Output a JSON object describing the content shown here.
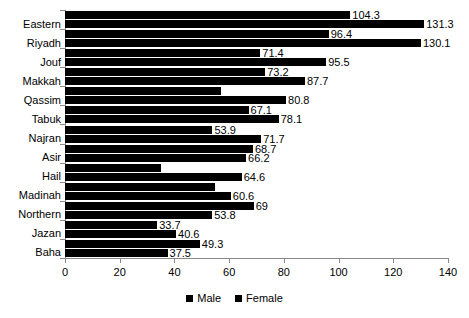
{
  "chart_data": {
    "type": "bar",
    "orientation": "horizontal",
    "title": "",
    "subtitle": "",
    "xlabel": "",
    "ylabel": "",
    "xlim": [
      0,
      140
    ],
    "xticks": [
      0,
      20,
      40,
      60,
      80,
      100,
      120,
      140
    ],
    "xtick_labels": [
      "0",
      "20",
      "40",
      "60",
      "80",
      "100",
      "120",
      "140"
    ],
    "grid": false,
    "legend_position": "bottom",
    "bar_color": "#000000",
    "categories": [
      "Eastern",
      "Riyadh",
      "Jouf",
      "Makkah",
      "Qassim",
      "Tabuk",
      "Najran",
      "Asir",
      "Hail",
      "Madinah",
      "Northern",
      "Jazan",
      "Baha"
    ],
    "series": [
      {
        "name": "Male",
        "color": "#000000",
        "values": [
          104.3,
          96.4,
          71.4,
          73.2,
          57.0,
          67.1,
          53.9,
          68.7,
          35.0,
          55.0,
          69.0,
          33.7,
          49.3
        ],
        "labels": [
          "104.3",
          "96.4",
          "71.4",
          "73.2",
          "",
          "67.1",
          "53.9",
          "68.7",
          "",
          "",
          "69",
          "33.7",
          "49.3"
        ]
      },
      {
        "name": "Female",
        "color": "#000000",
        "values": [
          131.3,
          130.1,
          95.5,
          87.7,
          80.8,
          78.1,
          71.7,
          66.2,
          64.6,
          60.6,
          53.8,
          40.6,
          37.5
        ],
        "labels": [
          "131.3",
          "130.1",
          "95.5",
          "87.7",
          "80.8",
          "78.1",
          "71.7",
          "66.2",
          "64.6",
          "60.6",
          "53.8",
          "40.6",
          "37.5"
        ]
      }
    ]
  },
  "legend": {
    "items": [
      {
        "label": "Male"
      },
      {
        "label": "Female"
      }
    ]
  }
}
